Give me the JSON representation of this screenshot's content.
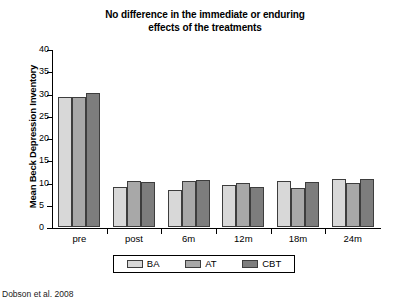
{
  "chart_data": {
    "type": "bar",
    "title": "No difference in the immediate or enduring effects of the treatments",
    "title_lines": [
      "No difference in the immediate or enduring",
      "effects of the treatments"
    ],
    "xlabel": "",
    "ylabel": "Mean Beck Depression Inventory",
    "ylim": [
      0,
      40
    ],
    "ytick_step": 5,
    "yticks": [
      40,
      35,
      30,
      25,
      20,
      15,
      10,
      5,
      0
    ],
    "ytick_labels": [
      "40",
      "35",
      "30",
      "25",
      "20",
      "15",
      "10",
      "5",
      "0"
    ],
    "categories": [
      "pre",
      "post",
      "6m",
      "12m",
      "18m",
      "24m"
    ],
    "grid": false,
    "legend_position": "bottom",
    "series": [
      {
        "name": "BA",
        "color": "#d8d8d8",
        "values": [
          29.3,
          9.0,
          8.4,
          9.5,
          10.3,
          10.8
        ]
      },
      {
        "name": "AT",
        "color": "#a8a8a8",
        "values": [
          29.2,
          10.3,
          10.3,
          10.0,
          8.8,
          10.0
        ]
      },
      {
        "name": "CBT",
        "color": "#7d7d7d",
        "values": [
          30.2,
          10.2,
          10.6,
          9.0,
          10.2,
          10.8
        ]
      }
    ]
  },
  "caption": "Dobson et al. 2008"
}
